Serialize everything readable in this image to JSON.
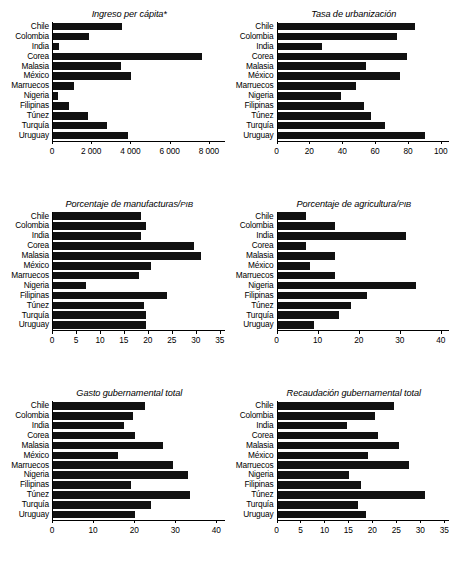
{
  "figure": {
    "categories": [
      "Chile",
      "Colombia",
      "India",
      "Corea",
      "Malasia",
      "México",
      "Marruecos",
      "Nigeria",
      "Filipinas",
      "Túnez",
      "Turquía",
      "Uruguay"
    ]
  },
  "chart_data": [
    {
      "type": "bar",
      "orientation": "horizontal",
      "title": "Ingreso per cápita*",
      "title_note": "*",
      "categories": [
        "Chile",
        "Colombia",
        "India",
        "Corea",
        "Malasia",
        "México",
        "Marruecos",
        "Nigeria",
        "Filipinas",
        "Túnez",
        "Turquía",
        "Uruguay"
      ],
      "values": [
        3560,
        1860,
        330,
        7660,
        3480,
        3980,
        1100,
        260,
        820,
        1790,
        2790,
        3850
      ],
      "xlabel": "",
      "ylabel": "",
      "xlim": [
        0,
        8800
      ],
      "ticks": [
        0,
        2000,
        4000,
        6000,
        8000
      ],
      "ticklabels": [
        "0",
        "2 000",
        "4 000",
        "6 000",
        "8 000"
      ],
      "grid": false,
      "legend": false
    },
    {
      "type": "bar",
      "orientation": "horizontal",
      "title": "Tasa de urbanización",
      "categories": [
        "Chile",
        "Colombia",
        "India",
        "Corea",
        "Malasia",
        "México",
        "Marruecos",
        "Nigeria",
        "Filipinas",
        "Túnez",
        "Turquía",
        "Uruguay"
      ],
      "values": [
        84,
        73,
        27,
        79,
        54,
        75,
        48,
        39,
        53,
        57,
        66,
        90
      ],
      "xlabel": "",
      "ylabel": "",
      "xlim": [
        0,
        105
      ],
      "ticks": [
        0,
        20,
        40,
        60,
        80,
        100
      ],
      "ticklabels": [
        "0",
        "20",
        "40",
        "60",
        "80",
        "100"
      ],
      "grid": false,
      "legend": false
    },
    {
      "type": "bar",
      "orientation": "horizontal",
      "title": "Porcentaje de manufacturas/PIB",
      "title_smallcaps": "PIB",
      "categories": [
        "Chile",
        "Colombia",
        "India",
        "Corea",
        "Malasia",
        "México",
        "Marruecos",
        "Nigeria",
        "Filipinas",
        "Túnez",
        "Turquía",
        "Uruguay"
      ],
      "values": [
        18.5,
        19.5,
        18.5,
        29.5,
        31,
        20.5,
        18,
        7,
        24,
        19,
        19.5,
        19.5
      ],
      "xlabel": "",
      "ylabel": "",
      "xlim": [
        0,
        36
      ],
      "ticks": [
        0,
        5,
        10,
        15,
        20,
        25,
        30,
        35
      ],
      "ticklabels": [
        "0",
        "5",
        "10",
        "15",
        "20",
        "25",
        "30",
        "35"
      ],
      "grid": false,
      "legend": false
    },
    {
      "type": "bar",
      "orientation": "horizontal",
      "title": "Porcentaje de agricultura/PIB",
      "title_smallcaps": "PIB",
      "categories": [
        "Chile",
        "Colombia",
        "India",
        "Corea",
        "Malasia",
        "México",
        "Marruecos",
        "Nigeria",
        "Filipinas",
        "Túnez",
        "Turquía",
        "Uruguay"
      ],
      "values": [
        7,
        14,
        31.5,
        7,
        14,
        8,
        14,
        34,
        22,
        18,
        15,
        9
      ],
      "xlabel": "",
      "ylabel": "",
      "xlim": [
        0,
        42
      ],
      "ticks": [
        0,
        10,
        20,
        30,
        40
      ],
      "ticklabels": [
        "0",
        "10",
        "20",
        "30",
        "40"
      ],
      "grid": false,
      "legend": false
    },
    {
      "type": "bar",
      "orientation": "horizontal",
      "title": "Gasto gubernamental total",
      "categories": [
        "Chile",
        "Colombia",
        "India",
        "Corea",
        "Malasia",
        "México",
        "Marruecos",
        "Nigeria",
        "Filipinas",
        "Túnez",
        "Turquía",
        "Uruguay"
      ],
      "values": [
        22.5,
        19.5,
        17.5,
        20,
        27,
        16,
        29.5,
        33,
        19,
        33.5,
        24,
        20
      ],
      "xlabel": "",
      "ylabel": "",
      "xlim": [
        0,
        42
      ],
      "ticks": [
        0,
        10,
        20,
        30,
        40
      ],
      "ticklabels": [
        "0",
        "10",
        "20",
        "30",
        "40"
      ],
      "grid": false,
      "legend": false
    },
    {
      "type": "bar",
      "orientation": "horizontal",
      "title": "Recaudación gubernamental total",
      "categories": [
        "Chile",
        "Colombia",
        "India",
        "Corea",
        "Malasia",
        "México",
        "Marruecos",
        "Nigeria",
        "Filipinas",
        "Túnez",
        "Turquía",
        "Uruguay"
      ],
      "values": [
        24.5,
        20.5,
        14.5,
        21,
        25.5,
        19,
        17,
        27.5,
        15,
        17.5,
        31,
        17.5,
        18.5
      ],
      "values_fixed": [
        24.5,
        20.5,
        14.5,
        21,
        25.5,
        19,
        27.5,
        15,
        17.5,
        31,
        17,
        18.5
      ],
      "xlabel": "",
      "ylabel": "",
      "xlim": [
        0,
        36
      ],
      "ticks": [
        0,
        5,
        10,
        15,
        20,
        25,
        30,
        35
      ],
      "ticklabels": [
        "0",
        "5",
        "10",
        "15",
        "20",
        "25",
        "30",
        "35"
      ],
      "grid": false,
      "legend": false
    }
  ]
}
